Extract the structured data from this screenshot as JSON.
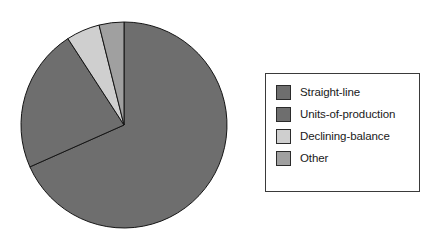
{
  "chart_data": {
    "type": "pie",
    "title": "",
    "subtitle": "",
    "xlabel": "",
    "ylabel": "",
    "grid": false,
    "legend_position": "right",
    "start_angle_deg": 0,
    "direction": "clockwise",
    "categories": [
      "Straight-line",
      "Units-of-production",
      "Declining-balance",
      "Other"
    ],
    "values": [
      68.3,
      22.5,
      5.3,
      3.9
    ],
    "value_unit": "percent",
    "angles_deg": [
      246,
      81,
      19,
      14
    ],
    "colors": [
      "#6e6e6e",
      "#6e6e6e",
      "#cfcfcf",
      "#a0a0a0"
    ],
    "slices": [
      {
        "label": "Straight-line",
        "value": 68.3,
        "angle_deg": 246,
        "color": "#6e6e6e"
      },
      {
        "label": "Units-of-production",
        "value": 22.5,
        "angle_deg": 81,
        "color": "#6e6e6e"
      },
      {
        "label": "Declining-balance",
        "value": 5.3,
        "angle_deg": 19,
        "color": "#cfcfcf"
      },
      {
        "label": "Other",
        "value": 3.9,
        "angle_deg": 14,
        "color": "#a0a0a0"
      }
    ],
    "outline_color": "#151515",
    "center_x": 124,
    "center_y": 125,
    "radius": 103
  },
  "legend": {
    "items": [
      {
        "label": "Straight-line",
        "color": "#6e6e6e"
      },
      {
        "label": "Units-of-production",
        "color": "#6e6e6e"
      },
      {
        "label": "Declining-balance",
        "color": "#cfcfcf"
      },
      {
        "label": "Other",
        "color": "#a0a0a0"
      }
    ],
    "border_color": "#3a3a3a",
    "background_color": "#ffffff"
  }
}
